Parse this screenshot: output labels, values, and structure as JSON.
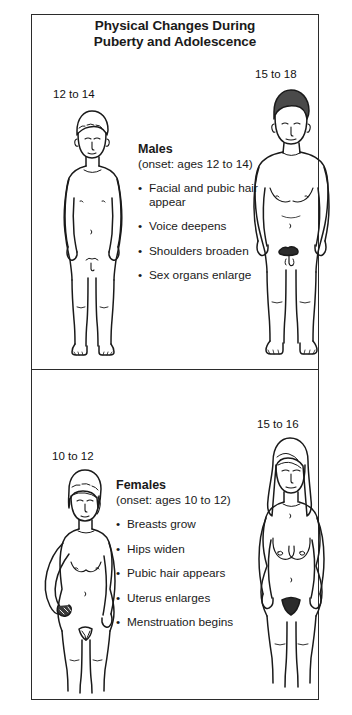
{
  "poster": {
    "title_line1": "Physical Changes During",
    "title_line2": "Puberty and Adolescence",
    "border_color": "#2b2b2b",
    "background": "#ffffff",
    "ink_color": "#1a1a1a"
  },
  "males": {
    "heading": "Males",
    "onset": "(onset: ages 12 to 14)",
    "bullet_char": "•",
    "figures": [
      {
        "id": "male-young",
        "age_label": "12 to 14",
        "hair_fill": "none",
        "stance": "arms-at-sides"
      },
      {
        "id": "male-older",
        "age_label": "15 to 18",
        "hair_fill": "#4a4a4a",
        "stance": "arms-at-sides"
      }
    ],
    "bullets": [
      "Facial and pubic hair appear",
      "Voice deepens",
      "Shoulders broaden",
      "Sex organs enlarge"
    ]
  },
  "females": {
    "heading": "Females",
    "onset": "(onset: ages 10 to 12)",
    "bullet_char": "•",
    "figures": [
      {
        "id": "female-young",
        "age_label": "10 to 12",
        "hair_fill": "none",
        "stance": "hand-on-hip"
      },
      {
        "id": "female-older",
        "age_label": "15 to 16",
        "hair_fill": "none",
        "stance": "arms-at-sides"
      }
    ],
    "bullets": [
      "Breasts grow",
      "Hips widen",
      "Pubic hair appears",
      "Uterus enlarges",
      "Menstruation begins"
    ]
  }
}
